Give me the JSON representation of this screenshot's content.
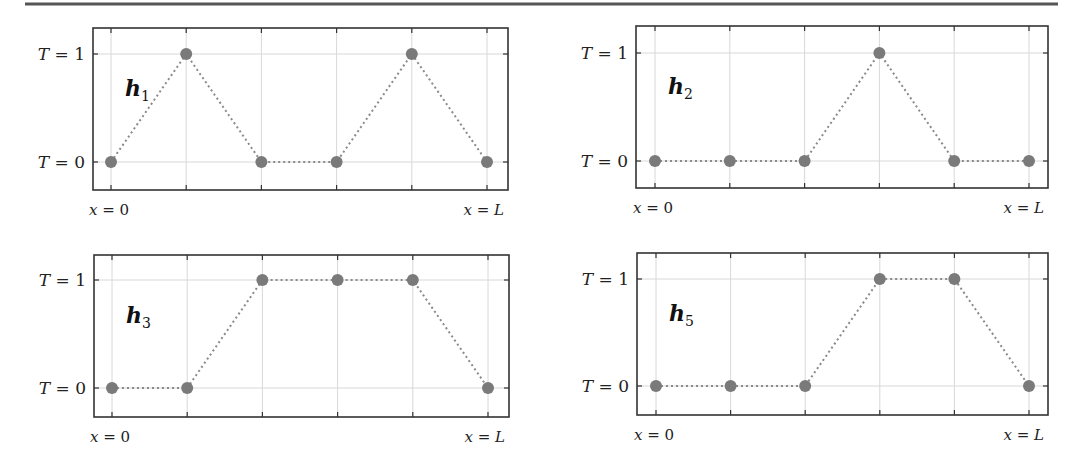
{
  "figure": {
    "top_rule": true
  },
  "labels": {
    "y_top": "T = 1",
    "y_bottom": "T = 0",
    "x_left": "x = 0",
    "x_right": "x = L"
  },
  "colors": {
    "point": "#7a7a7a",
    "connector": "#8a8a8a",
    "grid": "#d8d8d8",
    "frame": "#333333"
  },
  "chart_data": [
    {
      "type": "line",
      "title": "h1",
      "name_base": "h",
      "name_sub": "1",
      "x": [
        0,
        1,
        2,
        3,
        4,
        5
      ],
      "values": [
        0,
        1,
        0,
        0,
        1,
        0
      ],
      "xlabel_left": "x = 0",
      "xlabel_right": "x = L",
      "ytick_labels": [
        "T = 0",
        "T = 1"
      ],
      "ylim": [
        0,
        1
      ],
      "grid": true,
      "line_style": "dotted",
      "marker": "circle"
    },
    {
      "type": "line",
      "title": "h2",
      "name_base": "h",
      "name_sub": "2",
      "x": [
        0,
        1,
        2,
        3,
        4,
        5
      ],
      "values": [
        0,
        0,
        0,
        1,
        0,
        0
      ],
      "xlabel_left": "x = 0",
      "xlabel_right": "x = L",
      "ytick_labels": [
        "T = 0",
        "T = 1"
      ],
      "ylim": [
        0,
        1
      ],
      "grid": true,
      "line_style": "dotted",
      "marker": "circle"
    },
    {
      "type": "line",
      "title": "h3",
      "name_base": "h",
      "name_sub": "3",
      "x": [
        0,
        1,
        2,
        3,
        4,
        5
      ],
      "values": [
        0,
        0,
        1,
        1,
        1,
        0
      ],
      "xlabel_left": "x = 0",
      "xlabel_right": "x = L",
      "ytick_labels": [
        "T = 0",
        "T = 1"
      ],
      "ylim": [
        0,
        1
      ],
      "grid": true,
      "line_style": "dotted",
      "marker": "circle"
    },
    {
      "type": "line",
      "title": "h5",
      "name_base": "h",
      "name_sub": "5",
      "x": [
        0,
        1,
        2,
        3,
        4,
        5
      ],
      "values": [
        0,
        0,
        0,
        1,
        1,
        0
      ],
      "xlabel_left": "x = 0",
      "xlabel_right": "x = L",
      "ytick_labels": [
        "T = 0",
        "T = 1"
      ],
      "ylim": [
        0,
        1
      ],
      "grid": true,
      "line_style": "dotted",
      "marker": "circle"
    }
  ]
}
